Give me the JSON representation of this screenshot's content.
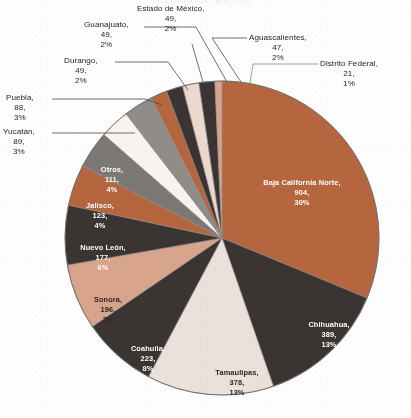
{
  "figure": {
    "background_color": "#fdfdfd",
    "title_remnant": "Estado de México",
    "center_x": 222,
    "center_y": 238,
    "radius": 157
  },
  "chart_data": {
    "type": "pie",
    "title": "",
    "subtitle": "",
    "xlabel": "",
    "ylabel": "",
    "legend_position": "none",
    "grid": false,
    "label_format": "name, value, percent",
    "total": 2993,
    "categories": [
      "Baja California Norte",
      "Chihuahua",
      "Tamaulipas",
      "Coahuila",
      "Sonora",
      "Nuevo León",
      "Jalisco",
      "Otros",
      "Yucatán",
      "Puebla",
      "Durango",
      "Guanajuato",
      "Estado de México",
      "Aguascalientes",
      "Distrito Federal"
    ],
    "values": [
      904,
      389,
      378,
      223,
      196,
      177,
      123,
      111,
      89,
      88,
      49,
      49,
      49,
      47,
      21
    ],
    "percents": [
      30,
      13,
      13,
      8,
      7,
      6,
      4,
      4,
      3,
      3,
      2,
      2,
      2,
      2,
      1
    ],
    "colors": [
      "#b5663f",
      "#3a3532",
      "#ece0da",
      "#3a3532",
      "#d8a48c",
      "#3a3532",
      "#b5663f",
      "#7c7975",
      "#f7f4f0",
      "#908d88",
      "#b5663f",
      "#3a3532",
      "#ecd9cd",
      "#3a3532",
      "#d8a48c"
    ],
    "slices": [
      {
        "name": "Baja California Norte",
        "value": 904,
        "percent": 30,
        "color": "#b5663f",
        "label_placement": "inside",
        "label_color": "light"
      },
      {
        "name": "Chihuahua",
        "value": 389,
        "percent": 13,
        "color": "#3a3532",
        "label_placement": "inside",
        "label_color": "light"
      },
      {
        "name": "Tamaulipas",
        "value": 378,
        "percent": 13,
        "color": "#ece0da",
        "label_placement": "inside",
        "label_color": "dark"
      },
      {
        "name": "Coahuila",
        "value": 223,
        "percent": 8,
        "color": "#3a3532",
        "label_placement": "inside",
        "label_color": "light"
      },
      {
        "name": "Sonora",
        "value": 196,
        "percent": 7,
        "color": "#d8a48c",
        "label_placement": "inside",
        "label_color": "dark"
      },
      {
        "name": "Nuevo León",
        "value": 177,
        "percent": 6,
        "color": "#3a3532",
        "label_placement": "inside",
        "label_color": "light"
      },
      {
        "name": "Jalisco",
        "value": 123,
        "percent": 4,
        "color": "#b5663f",
        "label_placement": "inside",
        "label_color": "light"
      },
      {
        "name": "Otros",
        "value": 111,
        "percent": 4,
        "color": "#7c7975",
        "label_placement": "inside",
        "label_color": "light"
      },
      {
        "name": "Yucatán",
        "value": 89,
        "percent": 3,
        "color": "#f7f4f0",
        "label_placement": "callout",
        "label_color": "dark"
      },
      {
        "name": "Puebla",
        "value": 88,
        "percent": 3,
        "color": "#908d88",
        "label_placement": "callout",
        "label_color": "dark"
      },
      {
        "name": "Durango",
        "value": 49,
        "percent": 2,
        "color": "#b5663f",
        "label_placement": "callout",
        "label_color": "dark"
      },
      {
        "name": "Guanajuato",
        "value": 49,
        "percent": 2,
        "color": "#3a3532",
        "label_placement": "callout",
        "label_color": "dark"
      },
      {
        "name": "Estado de México",
        "value": 49,
        "percent": 2,
        "color": "#ecd9cd",
        "label_placement": "callout",
        "label_color": "dark"
      },
      {
        "name": "Aguascalientes",
        "value": 47,
        "percent": 2,
        "color": "#3a3532",
        "label_placement": "callout",
        "label_color": "dark"
      },
      {
        "name": "Distrito Federal",
        "value": 21,
        "percent": 1,
        "color": "#d8a48c",
        "label_placement": "callout",
        "label_color": "dark"
      }
    ]
  },
  "inside_labels": [
    {
      "name": "baja-california-norte",
      "line1": "Baja California Norte,",
      "line2": "904,",
      "line3": "30%",
      "x": 302,
      "y": 183,
      "tone": "light"
    },
    {
      "name": "chihuahua",
      "line1": "Chihuahua,",
      "line2": "389,",
      "line3": "13%",
      "x": 329,
      "y": 325,
      "tone": "light"
    },
    {
      "name": "tamaulipas",
      "line1": "Tamaulipas,",
      "line2": "378,",
      "line3": "13%",
      "x": 237,
      "y": 373,
      "tone": "dark"
    },
    {
      "name": "coahuila",
      "line1": "Coahuila,",
      "line2": "223,",
      "line3": "8%",
      "x": 148,
      "y": 349,
      "tone": "light"
    },
    {
      "name": "sonora",
      "line1": "Sonora,",
      "line2": "196,",
      "line3": "7%",
      "x": 108,
      "y": 300,
      "tone": "dark"
    },
    {
      "name": "nuevo-leon",
      "line1": "Nuevo León,",
      "line2": "177,",
      "line3": "6%",
      "x": 103,
      "y": 248,
      "tone": "light"
    },
    {
      "name": "jalisco",
      "line1": "Jalisco,",
      "line2": "123,",
      "line3": "4%",
      "x": 100,
      "y": 206,
      "tone": "light"
    },
    {
      "name": "otros",
      "line1": "Otros,",
      "line2": "111,",
      "line3": "4%",
      "x": 112,
      "y": 170,
      "tone": "light"
    }
  ],
  "callout_labels": [
    {
      "name": "guanajuato",
      "line1": "Guanajuato,",
      "line2": "49,",
      "line3": "2%",
      "left": 84,
      "top": 20,
      "align": "c"
    },
    {
      "name": "estado-de-mexico",
      "line1": "Estado de México,",
      "line2": "49,",
      "line3": "2%",
      "left": 137,
      "top": 4,
      "align": "c"
    },
    {
      "name": "aguascalientes",
      "line1": "Aguascalientes,",
      "line2": "47,",
      "line3": "2%",
      "left": 249,
      "top": 33,
      "align": "c"
    },
    {
      "name": "distrito-federal",
      "line1": "Distrito Federal,",
      "line2": "21,",
      "line3": "1%",
      "left": 320,
      "top": 59,
      "align": "c"
    },
    {
      "name": "durango",
      "line1": "Durango,",
      "line2": "49,",
      "line3": "2%",
      "left": 64,
      "top": 56,
      "align": "c"
    },
    {
      "name": "puebla",
      "line1": "Puebla,",
      "line2": "88,",
      "line3": "3%",
      "left": 6,
      "top": 93,
      "align": "c"
    },
    {
      "name": "yucatan",
      "line1": "Yucatán,",
      "line2": "89,",
      "line3": "3%",
      "left": 3,
      "top": 127,
      "align": "c"
    }
  ],
  "leader_lines": [
    {
      "name": "guanajuato-leader",
      "points": "144,27 196,27 227,82",
      "color": "#4a4a4a"
    },
    {
      "name": "estado-de-mexico-leader",
      "points": "192,44 203,82",
      "color": "#4a4a4a"
    },
    {
      "name": "aguascalientes-leader",
      "points": "247,38 212,38 241,82",
      "color": "#4a4a4a"
    },
    {
      "name": "distrito-federal-leader",
      "points": "318,64 253,64 250,83",
      "color": "#6f9e5f"
    },
    {
      "name": "durango-leader",
      "points": "115,62 168,62 188,90",
      "color": "#4a4a4a"
    },
    {
      "name": "puebla-leader",
      "points": "52,99 145,99 162,105",
      "color": "#4a4a4a"
    },
    {
      "name": "yucatan-leader",
      "points": "52,133 135,133",
      "color": "#4a4a4a"
    }
  ]
}
